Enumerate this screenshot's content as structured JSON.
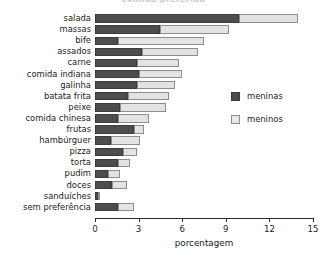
{
  "chart_data": {
    "type": "bar",
    "orientation": "horizontal",
    "stacked": true,
    "title": "comida preferida",
    "xlabel": "porcentagem",
    "ylabel": "",
    "xlim": [
      0,
      15
    ],
    "xticks": [
      0,
      3,
      6,
      9,
      12,
      15
    ],
    "xtick_labels": [
      "0",
      "3",
      "6",
      "9",
      "12",
      "15"
    ],
    "grid": false,
    "legend_position": "right",
    "categories": [
      "salada",
      "massas",
      "bife",
      "assados",
      "carne",
      "comida indiana",
      "galinha",
      "batata frita",
      "peixe",
      "comida chinesa",
      "frutas",
      "hambúrguer",
      "pizza",
      "torta",
      "pudim",
      "doces",
      "sanduíches",
      "sem preferência"
    ],
    "series": [
      {
        "name": "meninas",
        "color": "#4d4d4d",
        "values": [
          9.9,
          4.5,
          1.6,
          3.2,
          2.9,
          3.0,
          2.9,
          2.3,
          1.7,
          1.6,
          2.7,
          1.1,
          1.9,
          1.6,
          0.9,
          1.2,
          0.2,
          1.6
        ]
      },
      {
        "name": "meninos",
        "color": "#e3e3e3",
        "values": [
          4.1,
          4.7,
          5.9,
          3.9,
          2.9,
          3.0,
          2.6,
          2.8,
          3.2,
          2.1,
          0.7,
          2.0,
          1.0,
          0.8,
          0.8,
          1.0,
          0.15,
          1.1
        ]
      }
    ],
    "totals": [
      14.0,
      9.2,
      7.5,
      7.1,
      5.8,
      6.0,
      5.5,
      5.1,
      4.9,
      3.7,
      3.4,
      3.1,
      2.9,
      2.4,
      1.7,
      2.2,
      0.35,
      2.7
    ]
  }
}
